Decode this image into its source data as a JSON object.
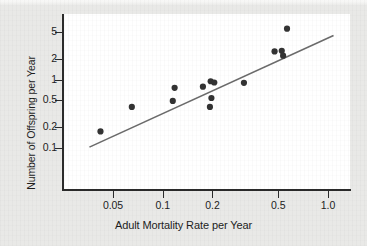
{
  "figure": {
    "background_color": "#e9e9e7",
    "panel_color": "#ffffff",
    "axis_color": "#2b2b2b",
    "point_color": "#333333",
    "line_color": "#6b6b6b"
  },
  "chart_data": {
    "type": "scatter",
    "title": "",
    "xlabel": "Adult Mortality Rate per Year",
    "ylabel": "Number of Offspring per Year",
    "xscale": "log",
    "yscale": "log",
    "grid": false,
    "legend": null,
    "xlim": [
      0.032,
      1.2
    ],
    "ylim": [
      0.1,
      6.5
    ],
    "xticks": [
      0.05,
      0.1,
      0.2,
      0.5,
      1.0
    ],
    "xtick_labels": [
      "0.05",
      "0.1",
      "0.2",
      "0.5",
      "1.0"
    ],
    "yticks": [
      0.1,
      0.2,
      0.5,
      1,
      2,
      5
    ],
    "ytick_labels": [
      "0.1",
      "0.2",
      "0.5",
      "1",
      "2",
      "5"
    ],
    "points": [
      {
        "x": 0.042,
        "y": 0.175
      },
      {
        "x": 0.065,
        "y": 0.4
      },
      {
        "x": 0.115,
        "y": 0.49
      },
      {
        "x": 0.118,
        "y": 0.76
      },
      {
        "x": 0.175,
        "y": 0.79
      },
      {
        "x": 0.195,
        "y": 0.95
      },
      {
        "x": 0.205,
        "y": 0.91
      },
      {
        "x": 0.197,
        "y": 0.54
      },
      {
        "x": 0.193,
        "y": 0.4
      },
      {
        "x": 0.31,
        "y": 0.9
      },
      {
        "x": 0.475,
        "y": 2.6
      },
      {
        "x": 0.525,
        "y": 2.65
      },
      {
        "x": 0.535,
        "y": 2.25
      },
      {
        "x": 0.565,
        "y": 5.6
      }
    ],
    "trend_line": {
      "type": "regression-line",
      "p1": {
        "x": 0.036,
        "y": 0.103
      },
      "p2": {
        "x": 1.08,
        "y": 4.45
      }
    },
    "annotations": []
  }
}
